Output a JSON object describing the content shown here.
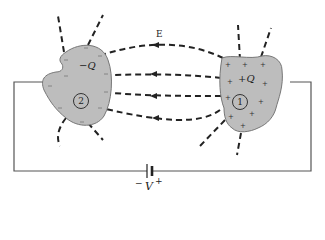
{
  "diagram": {
    "field_label": "E",
    "conductor_left": {
      "charge_label": "−Q",
      "number": "2",
      "surface_sign": "−",
      "fill_color": "#bdbdbd"
    },
    "conductor_right": {
      "charge_label": "+Q",
      "number": "1",
      "surface_sign": "+",
      "fill_color": "#bdbdbd"
    },
    "battery": {
      "label": "V",
      "minus_sign": "−",
      "plus_sign": "+"
    },
    "field_line_direction": "from +Q (right) to −Q (left)",
    "colors": {
      "line": "#222222",
      "wire": "#555555",
      "conductor_fill": "#bdbdbd",
      "conductor_stroke": "#777777"
    }
  }
}
